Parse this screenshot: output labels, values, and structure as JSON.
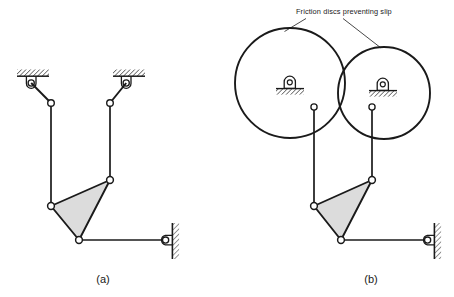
{
  "figure": {
    "background_color": "#ffffff",
    "line_color": "#1a1a1a",
    "fill_color": "#dcdcdc",
    "joint_fill": "#ffffff"
  },
  "annotations": {
    "friction_label": "Friction discs preventing slip"
  },
  "captions": {
    "left": "(a)",
    "right": "(b)"
  },
  "panel_a": {
    "label": "(a)",
    "caption_position": {
      "x": 103,
      "y": 281
    },
    "supports": [
      {
        "name": "upper-left-ground-support",
        "hatch_x": 17,
        "hatch_y": 70,
        "hatch_w": 32,
        "hatch_h": 6,
        "pivot_cx": 31,
        "pivot_cy": 83,
        "pivot_r": 4.2
      },
      {
        "name": "upper-right-ground-support",
        "hatch_x": 114,
        "hatch_y": 70,
        "hatch_w": 32,
        "hatch_h": 6,
        "pivot_cx": 126,
        "pivot_cy": 83,
        "pivot_r": 4.2
      }
    ],
    "wall_support": {
      "name": "right-wall-pin-support",
      "wall_x": 173,
      "wall_y_top": 223,
      "wall_y_bot": 259,
      "pivot_cx": 165,
      "pivot_cy": 240,
      "pivot_r": 4.6
    },
    "joints": [
      {
        "name": "joint-left-crank-end",
        "cx": 51,
        "cy": 103,
        "r": 3.4
      },
      {
        "name": "joint-right-crank-end",
        "cx": 110,
        "cy": 103,
        "r": 3.4
      },
      {
        "name": "joint-coupler-left",
        "cx": 51,
        "cy": 206,
        "r": 3.4
      },
      {
        "name": "joint-coupler-top",
        "cx": 110,
        "cy": 180,
        "r": 3.4
      },
      {
        "name": "joint-coupler-bottom",
        "cx": 79,
        "cy": 240,
        "r": 3.4
      }
    ],
    "links": [
      {
        "name": "link-upper-left-crank",
        "x1": 31,
        "y1": 83,
        "x2": 51,
        "y2": 103
      },
      {
        "name": "link-upper-right-crank",
        "x1": 126,
        "y1": 83,
        "x2": 110,
        "y2": 103
      },
      {
        "name": "link-left-vertical",
        "x1": 51,
        "y1": 103,
        "x2": 51,
        "y2": 206
      },
      {
        "name": "link-right-vertical",
        "x1": 110,
        "y1": 103,
        "x2": 110,
        "y2": 180
      },
      {
        "name": "link-output-horizontal",
        "x1": 79,
        "y1": 240,
        "x2": 165,
        "y2": 240
      }
    ],
    "ternary_link": {
      "name": "ternary-coupler-triangle",
      "points": "51,206 110,180 79,240"
    }
  },
  "panel_b": {
    "label": "(b)",
    "caption_position": {
      "x": 371,
      "y": 281
    },
    "discs": [
      {
        "name": "friction-disc-left",
        "cx": 290,
        "cy": 83,
        "r": 55
      },
      {
        "name": "friction-disc-right",
        "cx": 383,
        "cy": 93,
        "r": 46
      }
    ],
    "bearings": [
      {
        "name": "left-disc-bearing",
        "block_cx": 290,
        "block_cy": 83,
        "hatch_x": 276,
        "hatch_y": 88,
        "hatch_w": 30,
        "hatch_h": 6,
        "pin_r": 3.0
      },
      {
        "name": "right-disc-bearing",
        "block_cx": 383,
        "block_cy": 85,
        "hatch_x": 369,
        "hatch_y": 90,
        "hatch_w": 30,
        "hatch_h": 6,
        "pin_r": 3.0
      }
    ],
    "joints": [
      {
        "name": "joint-left-disc-pin",
        "cx": 314,
        "cy": 107,
        "r": 3.2
      },
      {
        "name": "joint-right-disc-pin",
        "cx": 372,
        "cy": 107,
        "r": 3.2
      },
      {
        "name": "joint-coupler-left",
        "cx": 314,
        "cy": 206,
        "r": 3.4
      },
      {
        "name": "joint-coupler-top",
        "cx": 372,
        "cy": 180,
        "r": 3.4
      },
      {
        "name": "joint-coupler-bottom",
        "cx": 341,
        "cy": 240,
        "r": 3.4
      }
    ],
    "links": [
      {
        "name": "link-left-vertical",
        "x1": 314,
        "y1": 107,
        "x2": 314,
        "y2": 206
      },
      {
        "name": "link-right-vertical",
        "x1": 372,
        "y1": 107,
        "x2": 372,
        "y2": 180
      },
      {
        "name": "link-output-horizontal",
        "x1": 341,
        "y1": 240,
        "x2": 427,
        "y2": 240
      }
    ],
    "ternary_link": {
      "name": "ternary-coupler-triangle",
      "points": "314,206 372,180 341,240"
    },
    "wall_support": {
      "name": "right-wall-pin-support",
      "wall_x": 435,
      "wall_y_top": 223,
      "wall_y_bot": 259,
      "pivot_cx": 427,
      "pivot_cy": 240,
      "pivot_r": 4.6
    },
    "leaders": [
      {
        "name": "leader-line-left-disc",
        "x1": 307,
        "y1": 18,
        "x2": 285,
        "y2": 31
      },
      {
        "name": "leader-line-right-disc",
        "x1": 344,
        "y1": 18,
        "x2": 380,
        "y2": 47
      }
    ],
    "label_position": {
      "x": 296,
      "y": 14
    }
  }
}
